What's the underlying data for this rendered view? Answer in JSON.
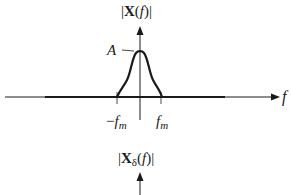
{
  "diagram": {
    "type": "frequency-spectrum-sketch",
    "colors": {
      "line": "#1a1a1a",
      "background": "#ffffff"
    },
    "top_plot": {
      "y_axis_label": "|X(f)|",
      "y_axis_label_parts": {
        "open": "|",
        "main": "X",
        "arg_open": "(",
        "arg": "f",
        "arg_close": ")",
        "close": "|"
      },
      "x_axis_label": "f",
      "peak_label": "A",
      "tick_left_label": {
        "sign": "−",
        "base": "f",
        "sub": "m"
      },
      "tick_right_label": {
        "base": "f",
        "sub": "m"
      },
      "shape": "bandlimited bump centered at f=0, nonzero between −f_m and f_m, peak value A"
    },
    "bottom_plot": {
      "y_axis_label": "|Xδ(f)|",
      "y_axis_label_parts": {
        "open": "|",
        "main": "X",
        "sub": "δ",
        "arg_open": "(",
        "arg": "f",
        "arg_close": ")",
        "close": "|"
      }
    }
  }
}
